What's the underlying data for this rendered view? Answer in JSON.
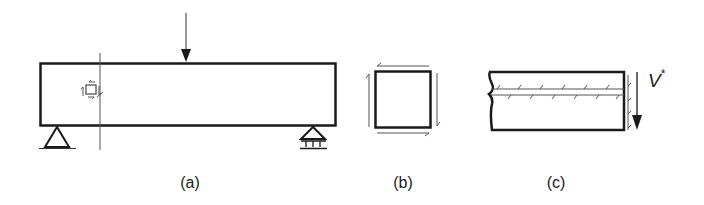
{
  "figure": {
    "panels": [
      {
        "id": "a",
        "label": "(a)",
        "description": "simply supported beam with central point load, section line and stress element"
      },
      {
        "id": "b",
        "label": "(b)",
        "description": "element with complementary shear stresses"
      },
      {
        "id": "c",
        "label": "(c)",
        "description": "beam segment with horizontal shear plane and applied shear"
      }
    ],
    "shear_force_label": "V",
    "shear_force_superscript": "*",
    "colors": {
      "line": "#1a1a1a",
      "thin_line": "#555555",
      "background": "#ffffff"
    }
  }
}
